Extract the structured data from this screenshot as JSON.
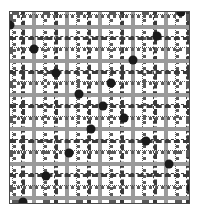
{
  "figure": {
    "kind": "scatter-plot",
    "width": 206,
    "height": 213,
    "background_color": "#ffffff",
    "frame_color": "#4a4a4a",
    "marker_color": "#1a1a1a",
    "marker_diameter": 9,
    "grid_solid_color": "#9a9a9a",
    "grid_dashed_color": "#3a3a3a",
    "grid_dotted_color": "#5a5a5a",
    "plot_left": 9,
    "plot_top": 11,
    "plot_width": 181,
    "plot_height": 193
  },
  "chart_data": {
    "type": "scatter",
    "title": "",
    "subtitle": "",
    "xlabel": "",
    "ylabel": "",
    "xlim": [
      0,
      181
    ],
    "ylim": [
      0,
      193
    ],
    "grid": true,
    "legend": null,
    "tick_labels": {
      "x": [],
      "y": []
    },
    "annotations": [],
    "series": [
      {
        "name": "points",
        "marker": "circle",
        "color": "#1a1a1a",
        "size": 9,
        "points": [
          {
            "x": 180,
            "y": 11
          },
          {
            "x": 9,
            "y": 24
          },
          {
            "x": 156,
            "y": 35
          },
          {
            "x": 33,
            "y": 48
          },
          {
            "x": 132,
            "y": 59
          },
          {
            "x": 55,
            "y": 72
          },
          {
            "x": 110,
            "y": 82
          },
          {
            "x": 78,
            "y": 93
          },
          {
            "x": 102,
            "y": 105
          },
          {
            "x": 123,
            "y": 117
          },
          {
            "x": 90,
            "y": 128
          },
          {
            "x": 145,
            "y": 140
          },
          {
            "x": 68,
            "y": 152
          },
          {
            "x": 168,
            "y": 163
          },
          {
            "x": 45,
            "y": 175
          },
          {
            "x": 190,
            "y": 187
          },
          {
            "x": 22,
            "y": 201
          }
        ]
      }
    ],
    "gridlines": {
      "vertical": [
        {
          "pos": 2,
          "style": "dotted"
        },
        {
          "pos": 11,
          "style": "dashed"
        },
        {
          "pos": 22,
          "style": "solid"
        },
        {
          "pos": 33,
          "style": "dotted"
        },
        {
          "pos": 44,
          "style": "dashed"
        },
        {
          "pos": 55,
          "style": "solid"
        },
        {
          "pos": 66,
          "style": "dotted"
        },
        {
          "pos": 77,
          "style": "dashed"
        },
        {
          "pos": 88,
          "style": "solid"
        },
        {
          "pos": 99,
          "style": "dotted"
        },
        {
          "pos": 110,
          "style": "dashed"
        },
        {
          "pos": 121,
          "style": "solid"
        },
        {
          "pos": 132,
          "style": "dotted"
        },
        {
          "pos": 143,
          "style": "dashed"
        },
        {
          "pos": 154,
          "style": "solid"
        },
        {
          "pos": 165,
          "style": "dotted"
        },
        {
          "pos": 176,
          "style": "dashed"
        }
      ],
      "horizontal": [
        {
          "pos": 2,
          "style": "dotted"
        },
        {
          "pos": 13,
          "style": "solid"
        },
        {
          "pos": 24,
          "style": "dashed"
        },
        {
          "pos": 35,
          "style": "dotted"
        },
        {
          "pos": 47,
          "style": "solid"
        },
        {
          "pos": 58,
          "style": "dashed"
        },
        {
          "pos": 69,
          "style": "dotted"
        },
        {
          "pos": 81,
          "style": "solid"
        },
        {
          "pos": 92,
          "style": "dashed"
        },
        {
          "pos": 104,
          "style": "dotted"
        },
        {
          "pos": 115,
          "style": "solid"
        },
        {
          "pos": 127,
          "style": "dashed"
        },
        {
          "pos": 138,
          "style": "dotted"
        },
        {
          "pos": 150,
          "style": "solid"
        },
        {
          "pos": 161,
          "style": "dashed"
        },
        {
          "pos": 173,
          "style": "dotted"
        },
        {
          "pos": 184,
          "style": "solid"
        }
      ]
    }
  }
}
